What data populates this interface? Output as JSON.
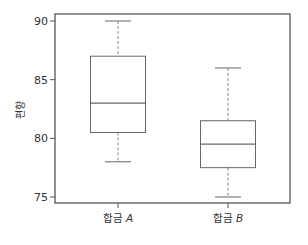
{
  "chart_data": {
    "type": "boxplot",
    "title": "",
    "xlabel": "",
    "ylabel": "편향",
    "ylim": [
      74.6,
      90.7
    ],
    "yticks": [
      75,
      80,
      85,
      90
    ],
    "grid": false,
    "categories": [
      "합금 A",
      "합금 B"
    ],
    "category_prefix": [
      "합금",
      "합금"
    ],
    "category_suffix": [
      "A",
      "B"
    ],
    "boxes": [
      {
        "name": "합금 A",
        "whisker_low": 78,
        "q1": 80.5,
        "median": 83,
        "q3": 87,
        "whisker_high": 90
      },
      {
        "name": "합금 B",
        "whisker_low": 75,
        "q1": 77.5,
        "median": 79.5,
        "q3": 81.5,
        "whisker_high": 86
      }
    ]
  },
  "style": {
    "frame_color": "#555555",
    "box_color": "#666666",
    "whisker_color": "#888888"
  }
}
